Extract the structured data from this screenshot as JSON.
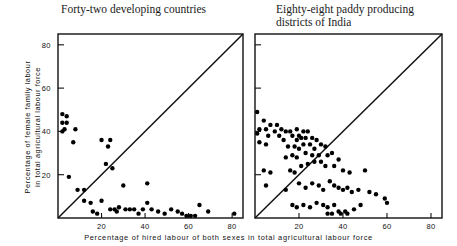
{
  "figure": {
    "xlabel": "Percentage of hired labour of both sexes in total agricultural labour force",
    "ylabel": "Percentage of female family labour\nin total agricultural labour force"
  },
  "chart_data": [
    {
      "type": "scatter",
      "title": "Forty-two developing countries",
      "xlabel": "Percentage of hired labour of both sexes in total agricultural labour force",
      "ylabel": "Percentage of female family labour in total agricultural labour force",
      "xlim": [
        0,
        85
      ],
      "ylim": [
        0,
        85
      ],
      "xticks": [
        20,
        40,
        60,
        80
      ],
      "yticks": [
        20,
        40,
        60,
        80
      ],
      "grid": false,
      "legend": null,
      "annotations": [
        "45-degree reference line from origin"
      ],
      "n_points": 42,
      "points": [
        [
          2,
          48
        ],
        [
          4,
          47
        ],
        [
          2,
          44
        ],
        [
          4,
          44
        ],
        [
          3,
          41
        ],
        [
          2,
          40
        ],
        [
          8,
          41
        ],
        [
          7,
          35
        ],
        [
          5,
          19
        ],
        [
          20,
          36
        ],
        [
          24,
          36
        ],
        [
          23,
          33
        ],
        [
          22,
          25
        ],
        [
          25,
          23
        ],
        [
          9,
          13
        ],
        [
          12,
          13
        ],
        [
          12,
          8
        ],
        [
          15,
          7
        ],
        [
          20,
          8
        ],
        [
          30,
          15
        ],
        [
          41,
          16
        ],
        [
          24,
          4
        ],
        [
          26,
          4
        ],
        [
          27,
          3
        ],
        [
          28,
          5
        ],
        [
          31,
          4
        ],
        [
          33,
          4
        ],
        [
          35,
          4
        ],
        [
          37,
          2
        ],
        [
          39,
          4
        ],
        [
          41,
          7
        ],
        [
          43,
          4
        ],
        [
          46,
          3
        ],
        [
          49,
          2
        ],
        [
          52,
          4
        ],
        [
          55,
          3
        ],
        [
          57,
          2
        ],
        [
          59,
          1
        ],
        [
          61,
          1
        ],
        [
          63,
          1
        ],
        [
          65,
          6
        ],
        [
          69,
          3
        ],
        [
          81,
          2
        ],
        [
          16,
          3
        ],
        [
          18,
          2
        ]
      ]
    },
    {
      "type": "scatter",
      "title": "Eighty-eight paddy producing\ndistricts of India",
      "xlabel": "Percentage of hired labour of both sexes in total agricultural labour force",
      "ylabel": "Percentage of female family labour in total agricultural labour force",
      "xlim": [
        0,
        85
      ],
      "ylim": [
        0,
        85
      ],
      "xticks": [
        20,
        40,
        60,
        80
      ],
      "yticks": [
        20,
        40,
        60,
        80
      ],
      "grid": false,
      "legend": null,
      "annotations": [
        "45-degree reference line from origin"
      ],
      "n_points": 88,
      "points": [
        [
          1,
          49
        ],
        [
          4,
          45
        ],
        [
          7,
          43
        ],
        [
          10,
          43
        ],
        [
          2,
          41
        ],
        [
          5,
          41
        ],
        [
          9,
          40
        ],
        [
          12,
          41
        ],
        [
          14,
          40
        ],
        [
          1,
          39
        ],
        [
          6,
          38
        ],
        [
          11,
          38
        ],
        [
          16,
          40
        ],
        [
          19,
          41
        ],
        [
          2,
          35
        ],
        [
          5,
          34
        ],
        [
          13,
          36
        ],
        [
          17,
          38
        ],
        [
          20,
          38
        ],
        [
          22,
          40
        ],
        [
          24,
          40
        ],
        [
          21,
          37
        ],
        [
          23,
          37
        ],
        [
          19,
          36
        ],
        [
          26,
          37
        ],
        [
          28,
          36
        ],
        [
          22,
          34
        ],
        [
          25,
          34
        ],
        [
          15,
          33
        ],
        [
          18,
          33
        ],
        [
          20,
          32
        ],
        [
          27,
          32
        ],
        [
          30,
          34
        ],
        [
          32,
          33
        ],
        [
          14,
          28
        ],
        [
          17,
          29
        ],
        [
          19,
          28
        ],
        [
          23,
          30
        ],
        [
          26,
          29
        ],
        [
          29,
          29
        ],
        [
          33,
          29
        ],
        [
          35,
          30
        ],
        [
          38,
          27
        ],
        [
          4,
          22
        ],
        [
          7,
          21
        ],
        [
          16,
          22
        ],
        [
          18,
          21
        ],
        [
          21,
          24
        ],
        [
          24,
          25
        ],
        [
          27,
          26
        ],
        [
          30,
          26
        ],
        [
          32,
          24
        ],
        [
          36,
          24
        ],
        [
          40,
          22
        ],
        [
          43,
          21
        ],
        [
          50,
          22
        ],
        [
          5,
          15
        ],
        [
          14,
          13
        ],
        [
          20,
          16
        ],
        [
          23,
          14
        ],
        [
          26,
          16
        ],
        [
          29,
          15
        ],
        [
          31,
          13
        ],
        [
          34,
          17
        ],
        [
          36,
          15
        ],
        [
          38,
          14
        ],
        [
          40,
          13
        ],
        [
          42,
          14
        ],
        [
          44,
          12
        ],
        [
          47,
          13
        ],
        [
          52,
          12
        ],
        [
          55,
          11
        ],
        [
          59,
          9
        ],
        [
          60,
          7
        ],
        [
          17,
          6
        ],
        [
          19,
          5
        ],
        [
          22,
          6
        ],
        [
          25,
          5
        ],
        [
          28,
          7
        ],
        [
          31,
          6
        ],
        [
          33,
          5
        ],
        [
          36,
          6
        ],
        [
          38,
          3
        ],
        [
          39,
          2
        ],
        [
          41,
          3
        ],
        [
          42,
          2
        ],
        [
          35,
          2
        ],
        [
          33,
          2
        ],
        [
          45,
          4
        ],
        [
          48,
          6
        ]
      ]
    }
  ]
}
